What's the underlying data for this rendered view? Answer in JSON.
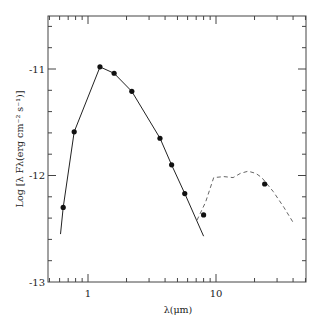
{
  "chart_data": {
    "type": "line",
    "title": "",
    "xlabel": "λ(μm)",
    "ylabel": "Log [λ Fλ(erg cm⁻² s⁻¹)]",
    "xscale": "log",
    "xlim": [
      0.49,
      50
    ],
    "ylim": [
      -13,
      -10.4
    ],
    "x_ticks_major": [
      {
        "value": 1,
        "label": "1"
      },
      {
        "value": 10,
        "label": "10"
      }
    ],
    "y_ticks_major": [
      {
        "value": -11,
        "label": "-11"
      },
      {
        "value": -12,
        "label": "-12"
      },
      {
        "value": -13,
        "label": "-13"
      }
    ],
    "grid": false,
    "legend": null,
    "series": [
      {
        "name": "observed photometry",
        "style": "markers",
        "x": [
          0.64,
          0.78,
          1.24,
          1.6,
          2.2,
          3.65,
          4.5,
          5.7,
          8.0,
          24
        ],
        "y": [
          -12.3,
          -11.59,
          -10.98,
          -11.04,
          -11.21,
          -11.65,
          -11.9,
          -12.17,
          -12.37,
          -12.08
        ]
      },
      {
        "name": "model fit (solid)",
        "style": "solid",
        "x": [
          0.61,
          0.64,
          0.78,
          1.24,
          1.6,
          2.2,
          3.65,
          4.5,
          5.7,
          8.0
        ],
        "y": [
          -12.55,
          -12.3,
          -11.59,
          -10.98,
          -11.04,
          -11.21,
          -11.65,
          -11.9,
          -12.17,
          -12.57
        ]
      },
      {
        "name": "IR spectrum (dashed)",
        "style": "dashed",
        "x": [
          7.1,
          8.3,
          9.6,
          11.5,
          13.6,
          15.5,
          17.8,
          20.5,
          22.8,
          28,
          34,
          40
        ],
        "y": [
          -12.42,
          -12.25,
          -12.02,
          -12.01,
          -12.02,
          -11.98,
          -11.96,
          -11.98,
          -12.02,
          -12.15,
          -12.3,
          -12.44
        ]
      }
    ]
  },
  "labels": {
    "x_axis": "λ(μm)",
    "y_axis": "Log [λ Fλ(erg cm⁻² s⁻¹)]",
    "x_tick_1": "1",
    "x_tick_10": "10",
    "y_tick_m11": "-11",
    "y_tick_m12": "-12",
    "y_tick_m13": "-13"
  }
}
